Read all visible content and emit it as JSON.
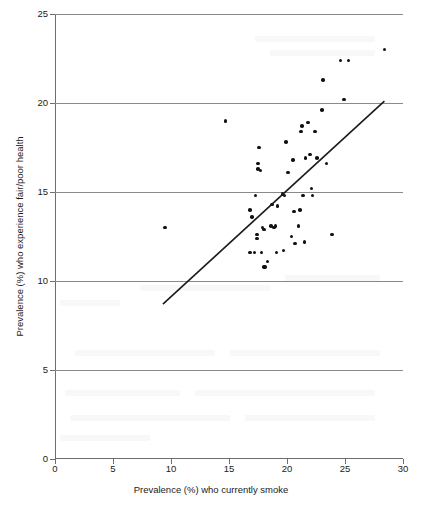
{
  "figure": {
    "width": 422,
    "height": 507,
    "background": "#ffffff",
    "point_color": "#111111",
    "gridline_color": "#8a8a8a",
    "axis_color": "#6e6e6e",
    "trendline_color": "#1a1a1a"
  },
  "axis_titles": {
    "x": "Prevalence (%) who currently smoke",
    "y": "Prevalence (%) who experience fair/poor health"
  },
  "ticks": {
    "x_labels": [
      "0",
      "5",
      "10",
      "15",
      "20",
      "25",
      "30"
    ],
    "y_labels": [
      "0",
      "5",
      "10",
      "15",
      "20",
      "25"
    ]
  },
  "chart_data": {
    "type": "scatter",
    "title": "",
    "xlabel": "Prevalence (%) who currently smoke",
    "ylabel": "Prevalence (%) who experience fair/poor health",
    "xlim": [
      0,
      30
    ],
    "ylim": [
      0,
      25
    ],
    "xticks": [
      0,
      5,
      10,
      15,
      20,
      25,
      30
    ],
    "yticks": [
      0,
      5,
      10,
      15,
      20,
      25
    ],
    "grid": "horizontal gridlines only, at y = 5, 10, 15, 20, 25",
    "legend": "none",
    "series": [
      {
        "name": "Local areas",
        "marker": "filled circle",
        "points": [
          [
            9.5,
            13.0
          ],
          [
            14.7,
            19.0
          ],
          [
            16.8,
            11.6
          ],
          [
            16.8,
            14.0
          ],
          [
            17.0,
            13.6
          ],
          [
            17.2,
            11.6
          ],
          [
            17.3,
            14.8
          ],
          [
            17.4,
            12.6
          ],
          [
            17.4,
            12.4
          ],
          [
            17.5,
            16.3
          ],
          [
            17.5,
            16.6
          ],
          [
            17.6,
            17.5
          ],
          [
            17.7,
            16.2
          ],
          [
            17.8,
            11.6
          ],
          [
            17.9,
            13.0
          ],
          [
            18.0,
            12.9
          ],
          [
            18.0,
            10.8
          ],
          [
            18.1,
            10.8
          ],
          [
            18.3,
            11.1
          ],
          [
            18.6,
            13.1
          ],
          [
            18.7,
            14.3
          ],
          [
            18.9,
            13.0
          ],
          [
            19.0,
            13.1
          ],
          [
            19.1,
            11.6
          ],
          [
            19.2,
            14.2
          ],
          [
            19.6,
            14.9
          ],
          [
            19.7,
            11.7
          ],
          [
            19.8,
            14.8
          ],
          [
            19.9,
            17.8
          ],
          [
            20.1,
            16.1
          ],
          [
            20.4,
            12.5
          ],
          [
            20.5,
            16.8
          ],
          [
            20.6,
            13.9
          ],
          [
            20.7,
            12.1
          ],
          [
            21.0,
            13.1
          ],
          [
            21.1,
            14.0
          ],
          [
            21.2,
            18.4
          ],
          [
            21.3,
            18.7
          ],
          [
            21.4,
            14.8
          ],
          [
            21.5,
            12.2
          ],
          [
            21.6,
            16.9
          ],
          [
            21.8,
            18.9
          ],
          [
            22.0,
            17.1
          ],
          [
            22.1,
            15.2
          ],
          [
            22.2,
            14.8
          ],
          [
            22.4,
            18.4
          ],
          [
            22.6,
            16.9
          ],
          [
            23.0,
            19.6
          ],
          [
            23.1,
            21.3
          ],
          [
            23.4,
            16.6
          ],
          [
            23.9,
            12.6
          ],
          [
            24.6,
            22.4
          ],
          [
            24.9,
            20.2
          ],
          [
            25.3,
            22.4
          ],
          [
            28.4,
            23.0
          ]
        ]
      }
    ],
    "trendline": {
      "name": "Fitted regression line",
      "from": [
        9.3,
        8.7
      ],
      "to": [
        28.4,
        20.1
      ]
    }
  }
}
